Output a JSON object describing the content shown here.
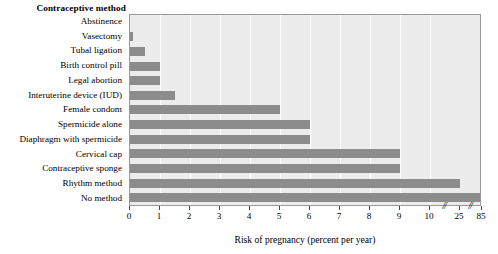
{
  "chart_data": {
    "type": "bar",
    "orientation": "horizontal",
    "title": "",
    "xlabel": "Risk of pregnancy (percent per year)",
    "ylabel": "Contraceptive method",
    "categories": [
      "Abstinence",
      "Vasectomy",
      "Tubal ligation",
      "Birth control pill",
      "Legal abortion",
      "Interuterine device (IUD)",
      "Female condom",
      "Spermicide alone",
      "Diaphragm with spermicide",
      "Cervical cap",
      "Contraceptive sponge",
      "Rhythm method",
      "No method"
    ],
    "values": [
      0,
      0.1,
      0.5,
      1,
      1,
      1.5,
      5,
      6,
      6,
      9,
      9,
      25,
      85
    ],
    "xticks": [
      0,
      1,
      2,
      3,
      4,
      5,
      6,
      7,
      8,
      9,
      10,
      25,
      85
    ],
    "xtick_labels": [
      "0",
      "1",
      "2",
      "3",
      "4",
      "5",
      "6",
      "7",
      "8",
      "9",
      "10",
      "25",
      "85"
    ],
    "axis_breaks": [
      {
        "after_value": 10,
        "glyph": "//"
      },
      {
        "after_value": 25,
        "glyph": "//"
      }
    ],
    "xlim": [
      0,
      85
    ],
    "grid": true,
    "grid_color": "#ffffff",
    "bar_color": "#8c8c8c",
    "plot_background": "#ececec",
    "plot_border_color": "#9a9a9a",
    "legend": null
  }
}
